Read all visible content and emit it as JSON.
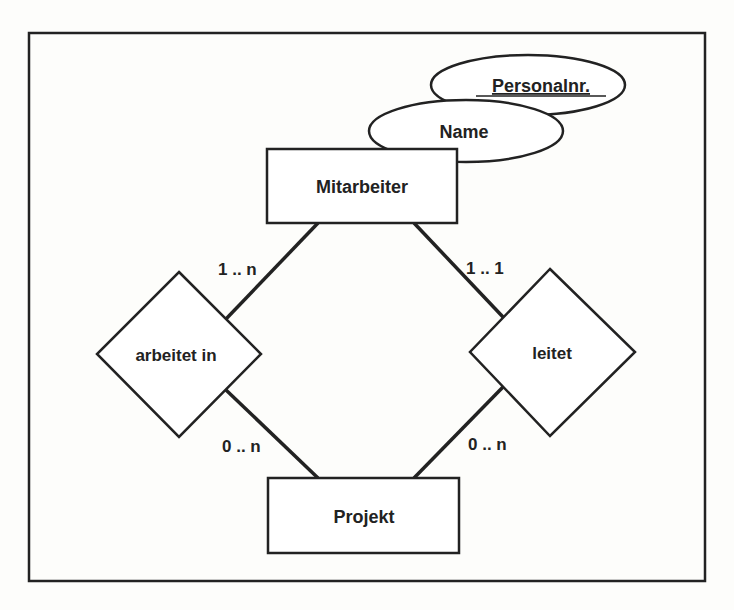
{
  "diagram": {
    "type": "er-diagram",
    "entities": [
      {
        "id": "mitarbeiter",
        "label": "Mitarbeiter"
      },
      {
        "id": "projekt",
        "label": "Projekt"
      }
    ],
    "attributes": [
      {
        "id": "personalnr",
        "label": "Personalnr.",
        "key": true,
        "entity": "mitarbeiter"
      },
      {
        "id": "name",
        "label": "Name",
        "key": false,
        "entity": "mitarbeiter"
      }
    ],
    "relationships": [
      {
        "id": "arbeitet_in",
        "label": "arbeitet in"
      },
      {
        "id": "leitet",
        "label": "leitet"
      }
    ],
    "cardinalities": {
      "mitarbeiter_arbeitet_in": "1 .. n",
      "arbeitet_in_projekt": "0 .. n",
      "mitarbeiter_leitet": "1 .. 1",
      "leitet_projekt": "0 .. n"
    },
    "colors": {
      "stroke": "#222222",
      "fill": "#ffffff",
      "background": "#fdfdfb"
    }
  }
}
